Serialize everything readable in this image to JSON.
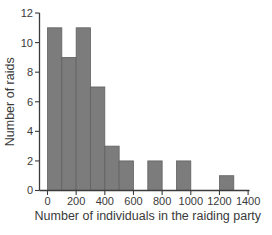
{
  "figure": {
    "background": "#ffffff"
  },
  "chart_data": {
    "type": "bar",
    "subtype": "histogram",
    "title": "",
    "xlabel": "Number of individuals in the raiding party",
    "ylabel": "Number of raids",
    "xlim": [
      0,
      1400
    ],
    "ylim": [
      0,
      12
    ],
    "grid": false,
    "legend": false,
    "bin_width": 100,
    "bins": [
      {
        "x0": 0,
        "x1": 100,
        "count": 11
      },
      {
        "x0": 100,
        "x1": 200,
        "count": 9
      },
      {
        "x0": 200,
        "x1": 300,
        "count": 11
      },
      {
        "x0": 300,
        "x1": 400,
        "count": 7
      },
      {
        "x0": 400,
        "x1": 500,
        "count": 3
      },
      {
        "x0": 500,
        "x1": 600,
        "count": 2
      },
      {
        "x0": 600,
        "x1": 700,
        "count": 0
      },
      {
        "x0": 700,
        "x1": 800,
        "count": 2
      },
      {
        "x0": 800,
        "x1": 900,
        "count": 0
      },
      {
        "x0": 900,
        "x1": 1000,
        "count": 2
      },
      {
        "x0": 1000,
        "x1": 1100,
        "count": 0
      },
      {
        "x0": 1100,
        "x1": 1200,
        "count": 0
      },
      {
        "x0": 1200,
        "x1": 1300,
        "count": 1
      },
      {
        "x0": 1300,
        "x1": 1400,
        "count": 0
      }
    ],
    "x_ticks": [
      "0",
      "200",
      "400",
      "600",
      "800",
      "1000",
      "1200",
      "1400"
    ],
    "x_tick_values": [
      0,
      200,
      400,
      600,
      800,
      1000,
      1200,
      1400
    ],
    "y_ticks": [
      "0",
      "2",
      "4",
      "6",
      "8",
      "10",
      "12"
    ],
    "y_tick_values": [
      0,
      2,
      4,
      6,
      8,
      10,
      12
    ],
    "colors": {
      "bar_fill": "#7c7c7c",
      "bar_stroke": "#616161",
      "axis": "#3b3b3b",
      "text": "#3a3a3a"
    }
  }
}
